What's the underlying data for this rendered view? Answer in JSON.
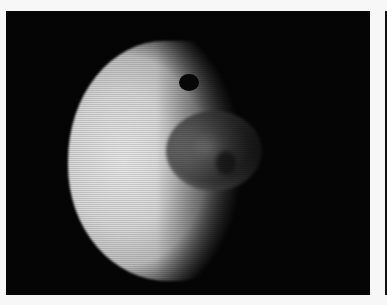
{
  "image": {
    "subject": "grayscale cratered moon on black background",
    "colors": {
      "background": "#050505",
      "margin": "#f7f7f7",
      "surface_light": "#e0e0e0",
      "crater_mid": "#7a7a7a",
      "pit": "#080808"
    }
  }
}
